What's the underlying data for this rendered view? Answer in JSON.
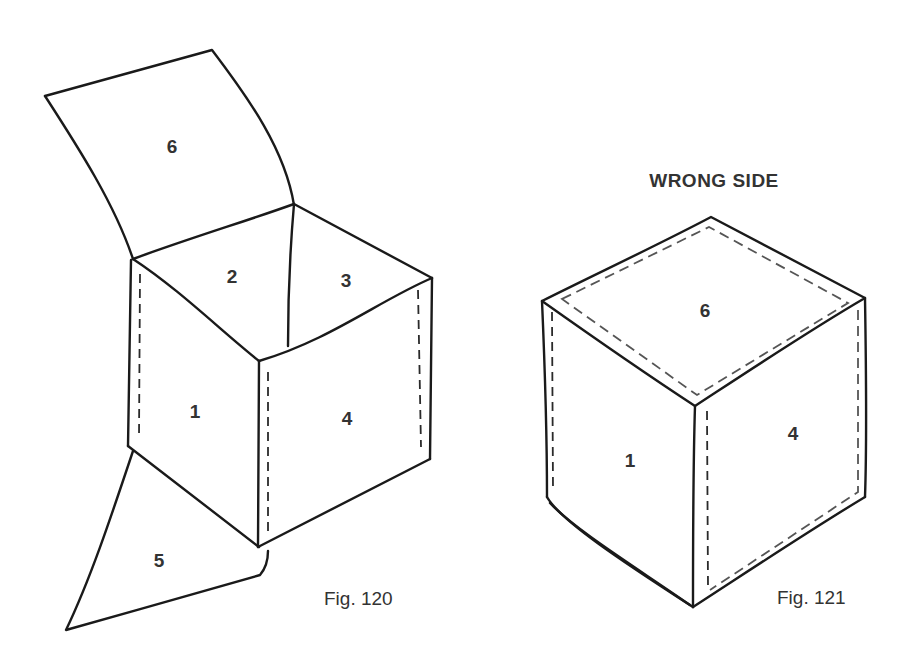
{
  "figures": [
    {
      "id": "fig120",
      "caption": "Fig. 120",
      "description": "Open cube with top flap and bottom flap unfolded",
      "face_labels": {
        "top_flap": "6",
        "inner_left": "2",
        "inner_right": "3",
        "left_face": "1",
        "right_face": "4",
        "bottom_flap": "5"
      }
    },
    {
      "id": "fig121",
      "caption": "Fig. 121",
      "heading": "WRONG SIDE",
      "description": "Closed cube shown wrong side out with seam lines",
      "face_labels": {
        "top": "6",
        "left_face": "1",
        "right_face": "4"
      }
    }
  ],
  "colors": {
    "line": "#1a1a1a",
    "text": "#333333",
    "background": "#ffffff"
  }
}
